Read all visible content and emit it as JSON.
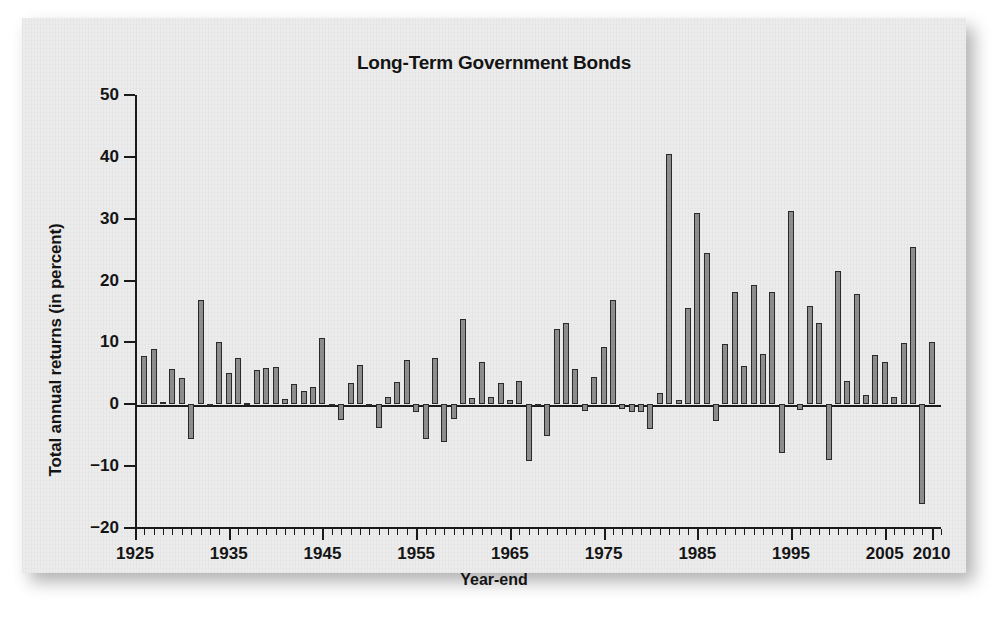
{
  "figure": {
    "title": "Long-Term Government Bonds",
    "xlabel": "Year-end",
    "ylabel": "Total annual returns (in percent)",
    "panel_color": "#ececed",
    "bar_fill": "#8e8e8e",
    "bar_stroke": "#2a2a2a",
    "axis_color": "#1a1a1a"
  },
  "chart_data": {
    "type": "bar",
    "title": "Long-Term Government Bonds",
    "xlabel": "Year-end",
    "ylabel": "Total annual returns (in percent)",
    "grid": false,
    "legend": "none",
    "ylim": [
      -20,
      50
    ],
    "ytick_values": [
      50,
      40,
      30,
      20,
      10,
      0,
      -10,
      -20
    ],
    "ytick_labels": [
      "50",
      "40",
      "30",
      "20",
      "10",
      "0",
      "−10",
      "−20"
    ],
    "xlim": [
      1925,
      2011
    ],
    "xtick_major_values": [
      1925,
      1935,
      1945,
      1955,
      1965,
      1975,
      1985,
      1995,
      2005,
      2010
    ],
    "xtick_major_labels": [
      "1925",
      "1935",
      "1945",
      "1955",
      "1965",
      "1975",
      "1985",
      "1995",
      "2005",
      "2010"
    ],
    "xtick_minor_step": 1,
    "categories": [
      1926,
      1927,
      1928,
      1929,
      1930,
      1931,
      1932,
      1933,
      1934,
      1935,
      1936,
      1937,
      1938,
      1939,
      1940,
      1941,
      1942,
      1943,
      1944,
      1945,
      1946,
      1947,
      1948,
      1949,
      1950,
      1951,
      1952,
      1953,
      1954,
      1955,
      1956,
      1957,
      1958,
      1959,
      1960,
      1961,
      1962,
      1963,
      1964,
      1965,
      1966,
      1967,
      1968,
      1969,
      1970,
      1971,
      1972,
      1973,
      1974,
      1975,
      1976,
      1977,
      1978,
      1979,
      1980,
      1981,
      1982,
      1983,
      1984,
      1985,
      1986,
      1987,
      1988,
      1989,
      1990,
      1991,
      1992,
      1993,
      1994,
      1995,
      1996,
      1997,
      1998,
      1999,
      2000,
      2001,
      2002,
      2003,
      2004,
      2005,
      2006,
      2007,
      2008,
      2009,
      2010
    ],
    "values": [
      7.8,
      8.9,
      0.3,
      5.7,
      4.3,
      -5.6,
      16.8,
      -0.1,
      10.0,
      5.0,
      7.5,
      0.2,
      5.5,
      5.9,
      6.1,
      0.9,
      3.2,
      2.1,
      2.8,
      10.7,
      -0.1,
      -2.6,
      3.4,
      6.4,
      0.1,
      -3.9,
      1.2,
      3.6,
      7.2,
      -1.3,
      -5.6,
      7.5,
      -6.1,
      -2.3,
      13.8,
      1.0,
      6.9,
      1.2,
      3.5,
      0.7,
      3.7,
      -9.2,
      -0.3,
      -5.1,
      12.1,
      13.2,
      5.7,
      -1.1,
      4.4,
      9.2,
      16.8,
      -0.7,
      -1.2,
      -1.2,
      -4.0,
      1.9,
      40.4,
      0.7,
      15.5,
      30.9,
      24.5,
      -2.7,
      9.7,
      18.1,
      6.2,
      19.3,
      8.1,
      18.2,
      -7.8,
      31.2,
      -0.9,
      15.9,
      13.1,
      -9.0,
      21.5,
      3.7,
      17.8,
      1.5,
      8.0,
      6.8,
      1.2,
      9.9,
      25.5,
      -16.1,
      10.0
    ]
  }
}
